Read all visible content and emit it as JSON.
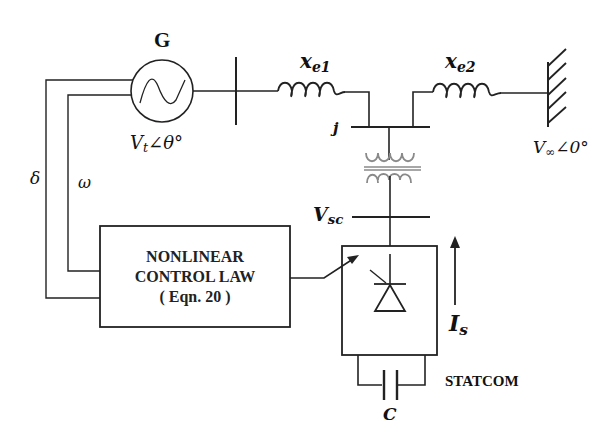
{
  "diagram": {
    "generator": {
      "label": "G",
      "voltage_label": "V",
      "voltage_sub": "t",
      "voltage_angle": "∠θ°"
    },
    "line1": {
      "label": "x",
      "sub": "e1"
    },
    "line2": {
      "label": "x",
      "sub": "e2"
    },
    "bus_j": {
      "label": "j"
    },
    "infinite_bus": {
      "label": "V",
      "sub": "∞",
      "angle": "∠0°"
    },
    "statcom_bus": {
      "label": "V",
      "sub": "sc"
    },
    "feedback": {
      "delta": "δ",
      "omega": "ω"
    },
    "controller": {
      "line1": "NONLINEAR",
      "line2": "CONTROL LAW",
      "line3": "( Eqn. 20 )"
    },
    "statcom": {
      "label": "STATCOM",
      "current_label": "I",
      "current_sub": "s",
      "capacitor_label": "C"
    },
    "colors": {
      "line": "#222222",
      "transformer": "#8a8a8a",
      "background": "#ffffff"
    }
  }
}
